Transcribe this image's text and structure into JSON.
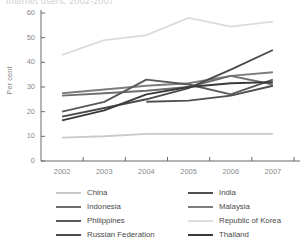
{
  "chart_title": "Internet users, 2002-2007",
  "axes": {
    "y_title": "Per cent",
    "y_ticks": [
      "0",
      "10",
      "20",
      "30",
      "40",
      "50",
      "60"
    ],
    "x_ticks": [
      "2002",
      "2003",
      "2004",
      "2005",
      "2006",
      "2007"
    ]
  },
  "legend": {
    "left_column": [
      {
        "label": "China",
        "color": "#c9c9c9"
      },
      {
        "label": "Indonesia",
        "color": "#6e6e6e"
      },
      {
        "label": "Philippines",
        "color": "#5a5a5a"
      },
      {
        "label": "Russian Federation",
        "color": "#4a4a4a"
      }
    ],
    "right_column": [
      {
        "label": "India",
        "color": "#4f4f4f"
      },
      {
        "label": "Malaysia",
        "color": "#7d7d7d"
      },
      {
        "label": "Republic of Korea",
        "color": "#dcdcdc"
      },
      {
        "label": "Thailand",
        "color": "#3a3a3a"
      }
    ]
  },
  "chart_data": {
    "type": "line",
    "title": "Internet users, 2002-2007",
    "xlabel": "",
    "ylabel": "Per cent",
    "ylim": [
      0,
      60
    ],
    "xlim": [
      "2002",
      "2007"
    ],
    "grid": false,
    "legend_position": "bottom",
    "categories": [
      "2002",
      "2003",
      "2004",
      "2005",
      "2006",
      "2007"
    ],
    "series": [
      {
        "name": "Republic of Korea",
        "color": "#dcdcdc",
        "values": [
          43.0,
          49.0,
          51.0,
          58.0,
          54.5,
          56.5
        ]
      },
      {
        "name": "Russian Federation",
        "color": "#4a4a4a",
        "values": [
          18.0,
          21.5,
          25.0,
          29.5,
          37.0,
          45.0
        ]
      },
      {
        "name": "Malaysia",
        "color": "#7d7d7d",
        "values": [
          27.5,
          29.0,
          30.5,
          31.5,
          34.5,
          36.0
        ]
      },
      {
        "name": "Indonesia",
        "color": "#6e6e6e",
        "values": [
          26.5,
          27.5,
          28.5,
          30.0,
          34.5,
          31.0
        ]
      },
      {
        "name": "Philippines",
        "color": "#5a5a5a",
        "values": [
          20.0,
          24.0,
          33.0,
          31.0,
          27.0,
          33.0
        ]
      },
      {
        "name": "Thailand",
        "color": "#3a3a3a",
        "values": [
          16.5,
          20.5,
          27.0,
          30.0,
          31.5,
          32.0
        ]
      },
      {
        "name": "India",
        "color": "#4f4f4f",
        "values": [
          null,
          null,
          24.0,
          24.5,
          26.5,
          30.5
        ]
      },
      {
        "name": "China",
        "color": "#c9c9c9",
        "values": [
          9.5,
          10.0,
          11.0,
          11.0,
          11.0,
          11.0
        ]
      }
    ]
  }
}
